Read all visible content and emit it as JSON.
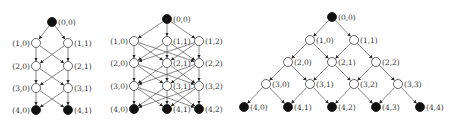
{
  "figure": {
    "colors": {
      "edge": "#555555",
      "open_node_fill": "#ffffff",
      "filled_node": "#111111",
      "label": "#333333"
    },
    "node_radius": 4.5,
    "graphs": [
      {
        "id": "graph-1",
        "type": "complete-layered",
        "rows": [
          {
            "y": 22,
            "nodes": [
              {
                "label": "(0,0)",
                "x": 52,
                "filled": true,
                "label_side": "right"
              }
            ]
          },
          {
            "y": 43,
            "nodes": [
              {
                "label": "(1,0)",
                "x": 36,
                "filled": false,
                "label_side": "left"
              },
              {
                "label": "(1,1)",
                "x": 68,
                "filled": false,
                "label_side": "right"
              }
            ]
          },
          {
            "y": 66,
            "nodes": [
              {
                "label": "(2,0)",
                "x": 36,
                "filled": false,
                "label_side": "left"
              },
              {
                "label": "(2,1)",
                "x": 68,
                "filled": false,
                "label_side": "right"
              }
            ]
          },
          {
            "y": 88,
            "nodes": [
              {
                "label": "(3,0)",
                "x": 36,
                "filled": false,
                "label_side": "left"
              },
              {
                "label": "(3,1)",
                "x": 68,
                "filled": false,
                "label_side": "right"
              }
            ]
          },
          {
            "y": 110,
            "nodes": [
              {
                "label": "(4,0)",
                "x": 36,
                "filled": true,
                "label_side": "left"
              },
              {
                "label": "(4,1)",
                "x": 68,
                "filled": true,
                "label_side": "right"
              }
            ]
          }
        ]
      },
      {
        "id": "graph-2",
        "type": "complete-layered",
        "rows": [
          {
            "y": 19,
            "nodes": [
              {
                "label": "(0,0)",
                "x": 167,
                "filled": true,
                "label_side": "right"
              }
            ]
          },
          {
            "y": 41,
            "nodes": [
              {
                "label": "(1,0)",
                "x": 134,
                "filled": false,
                "label_side": "left"
              },
              {
                "label": "(1,1)",
                "x": 167,
                "filled": false,
                "label_side": "right"
              },
              {
                "label": "(1,2)",
                "x": 199,
                "filled": false,
                "label_side": "right"
              }
            ]
          },
          {
            "y": 63,
            "nodes": [
              {
                "label": "(2,0)",
                "x": 134,
                "filled": false,
                "label_side": "left"
              },
              {
                "label": "(2,1)",
                "x": 167,
                "filled": false,
                "label_side": "right"
              },
              {
                "label": "(2,2)",
                "x": 199,
                "filled": false,
                "label_side": "right"
              }
            ]
          },
          {
            "y": 86,
            "nodes": [
              {
                "label": "(3,0)",
                "x": 134,
                "filled": false,
                "label_side": "left"
              },
              {
                "label": "(3,1)",
                "x": 167,
                "filled": false,
                "label_side": "right"
              },
              {
                "label": "(3,2)",
                "x": 199,
                "filled": false,
                "label_side": "right"
              }
            ]
          },
          {
            "y": 109,
            "nodes": [
              {
                "label": "(4,0)",
                "x": 134,
                "filled": true,
                "label_side": "left"
              },
              {
                "label": "(4,1)",
                "x": 167,
                "filled": true,
                "label_side": "right"
              },
              {
                "label": "(4,2)",
                "x": 199,
                "filled": true,
                "label_side": "right"
              }
            ]
          }
        ]
      },
      {
        "id": "graph-3",
        "type": "binomial-lattice",
        "rows": [
          {
            "y": 17,
            "nodes": [
              {
                "label": "(0,0)",
                "x": 332,
                "filled": true,
                "label_side": "right"
              }
            ]
          },
          {
            "y": 40,
            "nodes": [
              {
                "label": "(1,0)",
                "x": 310,
                "filled": false,
                "label_side": "right"
              },
              {
                "label": "(1,1)",
                "x": 354,
                "filled": false,
                "label_side": "right"
              }
            ]
          },
          {
            "y": 62,
            "nodes": [
              {
                "label": "(2,0)",
                "x": 288,
                "filled": false,
                "label_side": "right"
              },
              {
                "label": "(2,1)",
                "x": 332,
                "filled": false,
                "label_side": "right"
              },
              {
                "label": "(2,2)",
                "x": 376,
                "filled": false,
                "label_side": "right"
              }
            ]
          },
          {
            "y": 84,
            "nodes": [
              {
                "label": "(3,0)",
                "x": 266,
                "filled": false,
                "label_side": "right"
              },
              {
                "label": "(3,1)",
                "x": 310,
                "filled": false,
                "label_side": "right"
              },
              {
                "label": "(3,2)",
                "x": 354,
                "filled": false,
                "label_side": "right"
              },
              {
                "label": "(3,3)",
                "x": 398,
                "filled": false,
                "label_side": "right"
              }
            ]
          },
          {
            "y": 107,
            "nodes": [
              {
                "label": "(4,0)",
                "x": 244,
                "filled": true,
                "label_side": "right"
              },
              {
                "label": "(4,1)",
                "x": 288,
                "filled": true,
                "label_side": "right"
              },
              {
                "label": "(4,2)",
                "x": 332,
                "filled": true,
                "label_side": "right"
              },
              {
                "label": "(4,3)",
                "x": 376,
                "filled": true,
                "label_side": "right"
              },
              {
                "label": "(4,4)",
                "x": 420,
                "filled": true,
                "label_side": "right"
              }
            ]
          }
        ]
      }
    ]
  }
}
